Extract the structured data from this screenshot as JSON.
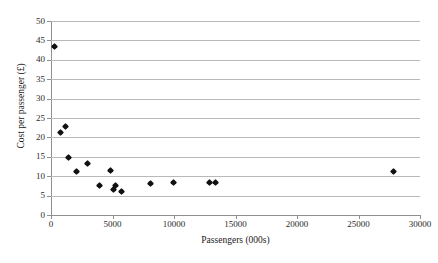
{
  "chart_data": {
    "type": "scatter",
    "title": "",
    "xlabel": "Passengers (000s)",
    "ylabel": "Cost per passenger (£)",
    "xlim": [
      0,
      30000
    ],
    "ylim": [
      0,
      50
    ],
    "xticks": [
      0,
      5000,
      10000,
      15000,
      20000,
      25000,
      30000
    ],
    "yticks": [
      0,
      5,
      10,
      15,
      20,
      25,
      30,
      35,
      40,
      45,
      50
    ],
    "grid": "horizontal",
    "legend": "none",
    "marker": "diamond",
    "marker_color": "#111111",
    "points": [
      {
        "x": 300,
        "y": 43.2
      },
      {
        "x": 800,
        "y": 21.1
      },
      {
        "x": 1200,
        "y": 22.8
      },
      {
        "x": 1500,
        "y": 14.7
      },
      {
        "x": 2100,
        "y": 11.1
      },
      {
        "x": 3000,
        "y": 13.1
      },
      {
        "x": 4000,
        "y": 7.4
      },
      {
        "x": 4900,
        "y": 11.3
      },
      {
        "x": 5100,
        "y": 6.5
      },
      {
        "x": 5300,
        "y": 7.6
      },
      {
        "x": 5800,
        "y": 5.8
      },
      {
        "x": 8100,
        "y": 8.0
      },
      {
        "x": 10000,
        "y": 8.2
      },
      {
        "x": 12900,
        "y": 8.2
      },
      {
        "x": 13400,
        "y": 8.2
      },
      {
        "x": 27900,
        "y": 11.1
      }
    ]
  }
}
